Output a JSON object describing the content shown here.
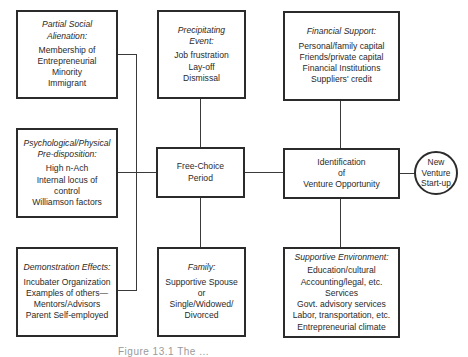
{
  "diagram": {
    "boxes": {
      "partial_social_alienation": {
        "heading": "Partial Social Alienation:",
        "lines": [
          "Membership of",
          "Entrepreneurial",
          "Minority",
          "Immigrant"
        ]
      },
      "precipitating_event": {
        "heading": "Precipitating Event:",
        "lines": [
          "Job frustration",
          "Lay-off",
          "Dismissal"
        ]
      },
      "financial_support": {
        "heading": "Financial Support:",
        "lines": [
          "Personal/family capital",
          "Friends/private capital",
          "Financial Institutions",
          "Suppliers' credit"
        ]
      },
      "psychological_predisposition": {
        "heading": "Psychological/Physical Pre-disposition:",
        "lines": [
          "High n-Ach",
          "Internal locus of",
          "control",
          "Williamson factors"
        ]
      },
      "free_choice_period": {
        "lines": [
          "Free-Choice",
          "Period"
        ]
      },
      "identification": {
        "lines": [
          "Identification",
          "of",
          "Venture Opportunity"
        ]
      },
      "demonstration_effects": {
        "heading": "Demonstration Effects:",
        "lines": [
          "Incubater Organization",
          "Examples of others—",
          "Mentors/Advisors",
          "Parent Self-employed"
        ]
      },
      "family": {
        "heading": "Family:",
        "lines": [
          "Supportive Spouse",
          "or",
          "Single/Widowed/",
          "Divorced"
        ]
      },
      "supportive_environment": {
        "heading": "Supportive Environment:",
        "lines": [
          "Education/cultural",
          "Accounting/legal, etc.",
          "Services",
          "Govt. advisory services",
          "Labor, transportation, etc.",
          "Entrepreneurial climate"
        ]
      }
    },
    "outcome": {
      "lines": [
        "New",
        "Venture",
        "Start-up"
      ]
    },
    "caption": "Figure 13.1  The ..."
  }
}
